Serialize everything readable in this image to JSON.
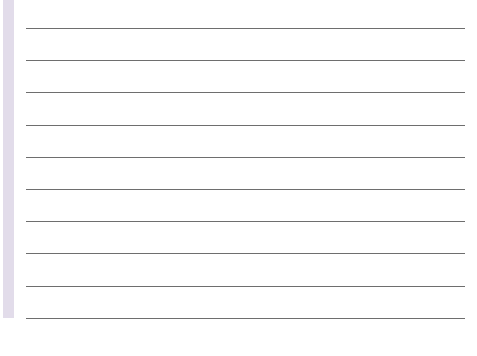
{
  "sheet": {
    "type": "lined-paper",
    "margin_strip_color": "#e2dcea",
    "line_color": "#6e6e6e",
    "line_count": 10,
    "line_positions_y": [
      28,
      60,
      92,
      125,
      157,
      189,
      221,
      253,
      286,
      318
    ]
  }
}
